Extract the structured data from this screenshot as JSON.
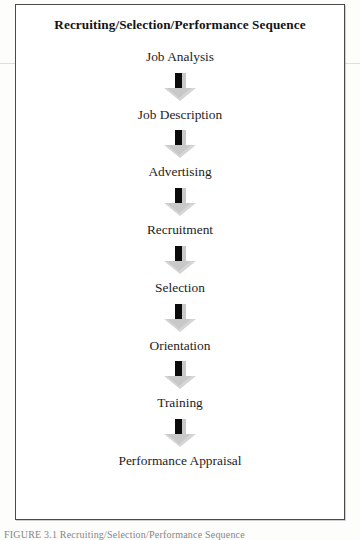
{
  "figure": {
    "title": "Recruiting/Selection/Performance Sequence",
    "stages": [
      "Job Analysis",
      "Job Description",
      "Advertising",
      "Recruitment",
      "Selection",
      "Orientation",
      "Training",
      "Performance Appraisal"
    ],
    "arrow_icon": "down-block-arrow-icon",
    "arrow_count": 7
  },
  "caption": {
    "text": "FIGURE 3.1   Recruiting/Selection/Performance Sequence"
  },
  "colors": {
    "border": "#4a4a4a",
    "title_text": "#131313",
    "label_text": "#1d1d1d",
    "arrow_shaft": "#0b0b0b",
    "arrow_shadow": "#c9c9c9",
    "arrow_head": "#d5d5d5",
    "page_background": "#fdfdfc",
    "scan_seam": "#d8d8d6"
  }
}
